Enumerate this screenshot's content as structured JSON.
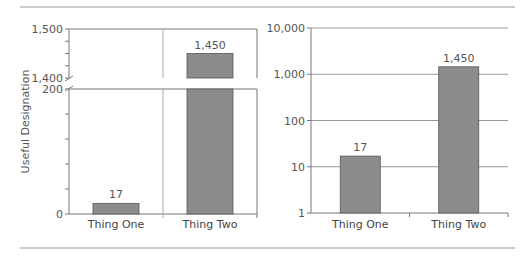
{
  "chart_data": [
    {
      "type": "bar",
      "title": "",
      "scale": "linear-broken",
      "ylabel": "Useful Designation",
      "xlabel": "",
      "categories": [
        "Thing One",
        "Thing Two"
      ],
      "values": [
        17,
        1450
      ],
      "data_labels": [
        "17",
        "1,450"
      ],
      "axis_break": {
        "lower": [
          0,
          200
        ],
        "upper": [
          1400,
          1500
        ]
      },
      "lower_ticks": [
        {
          "v": 0,
          "label": "0"
        },
        {
          "v": 40,
          "label": ""
        },
        {
          "v": 80,
          "label": ""
        },
        {
          "v": 120,
          "label": ""
        },
        {
          "v": 160,
          "label": ""
        },
        {
          "v": 200,
          "label": "200"
        }
      ],
      "upper_ticks": [
        {
          "v": 1400,
          "label": "1,400"
        },
        {
          "v": 1425,
          "label": ""
        },
        {
          "v": 1450,
          "label": ""
        },
        {
          "v": 1475,
          "label": ""
        },
        {
          "v": 1500,
          "label": "1,500"
        }
      ],
      "grid": false
    },
    {
      "type": "bar",
      "title": "",
      "scale": "log",
      "ylabel": "",
      "xlabel": "",
      "categories": [
        "Thing One",
        "Thing Two"
      ],
      "values": [
        17,
        1450
      ],
      "data_labels": [
        "17",
        "1,450"
      ],
      "ylim": [
        1,
        10000
      ],
      "ticks": [
        {
          "v": 1,
          "label": "1"
        },
        {
          "v": 10,
          "label": "10"
        },
        {
          "v": 100,
          "label": "100"
        },
        {
          "v": 1000,
          "label": "1,000"
        },
        {
          "v": 10000,
          "label": "10,000"
        }
      ],
      "grid": true
    }
  ],
  "colors": {
    "bar": "#8c8c8c",
    "bar_edge": "#555555",
    "axis": "#777777",
    "grid": "#999999",
    "rule": "#999999"
  }
}
